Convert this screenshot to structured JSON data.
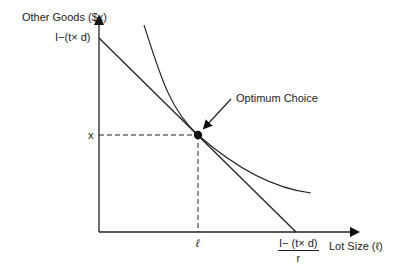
{
  "diagram": {
    "type": "indifference-curve-budget-line",
    "y_axis_label": "Other Goods ($x)",
    "x_axis_label": "Lot Size (ℓ)",
    "y_intercept_label": "I−(t× d)",
    "x_intercept_numerator": "I− (t× d)",
    "x_intercept_denominator": "r",
    "optimum_x_label": "ℓ",
    "optimum_y_label": "x",
    "annotation": "Optimum Choice",
    "colors": {
      "line": "#222222",
      "background": "#ffffff"
    }
  }
}
